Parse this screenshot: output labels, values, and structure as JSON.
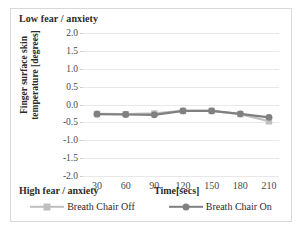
{
  "figure": {
    "top_annotation": "Low fear / anxiety",
    "bottom_annotation": "High fear / anxiety"
  },
  "chart_data": {
    "type": "line",
    "title": "",
    "xlabel": "Time[secs]",
    "ylabel": "Finger surface skin temperature [degrees]",
    "categories": [
      30,
      60,
      90,
      120,
      150,
      180,
      210
    ],
    "x_tick_labels": [
      "30",
      "60",
      "90",
      "120",
      "150",
      "180",
      "210"
    ],
    "y_tick_labels": [
      "2.0",
      "1.5",
      "1.0",
      "0.5",
      "0.0",
      "-0.5",
      "-1.0",
      "-1.5",
      "-2.0"
    ],
    "y_ticks": [
      2.0,
      1.5,
      1.0,
      0.5,
      0.0,
      -0.5,
      -1.0,
      -1.5,
      -2.0
    ],
    "ylim": [
      -2.0,
      2.0
    ],
    "grid": true,
    "legend_position": "bottom",
    "series": [
      {
        "name": "Breath Chair Off",
        "color": "#bfbfbf",
        "marker": "square",
        "values": [
          -0.26,
          -0.27,
          -0.25,
          -0.18,
          -0.18,
          -0.27,
          -0.47
        ]
      },
      {
        "name": "Breath Chair On",
        "color": "#808080",
        "marker": "circle",
        "values": [
          -0.27,
          -0.28,
          -0.29,
          -0.18,
          -0.18,
          -0.26,
          -0.36
        ]
      }
    ]
  },
  "colors": {
    "series_off": "#bfbfbf",
    "series_on": "#808080",
    "gridline": "#e8e8e8",
    "border": "#d9d9d9",
    "text": "#2b2b2b",
    "tick_text": "#4a4a4a"
  }
}
